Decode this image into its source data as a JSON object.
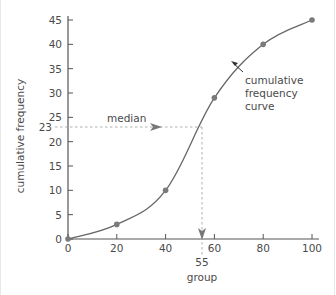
{
  "chart_data": {
    "type": "line",
    "title": "",
    "xlabel": "group",
    "ylabel": "cumulative frequency",
    "x": [
      0,
      20,
      40,
      60,
      80,
      100
    ],
    "series": [
      {
        "name": "cumulative frequency curve",
        "values": [
          0,
          3,
          10,
          29,
          40,
          45
        ]
      }
    ],
    "xlim": [
      0,
      100
    ],
    "ylim": [
      0,
      45
    ],
    "x_ticks": [
      "0",
      "20",
      "40",
      "60",
      "80",
      "100"
    ],
    "y_ticks": [
      "0",
      "5",
      "10",
      "15",
      "20",
      "25",
      "30",
      "35",
      "40",
      "45"
    ],
    "grid": false,
    "legend": "none",
    "annotations": [
      {
        "text": "median",
        "type": "dashed-arrow",
        "y": 23,
        "x_end": 55
      },
      {
        "text": "cumulative frequency curve",
        "type": "arrow-label",
        "points_to_x": 70
      },
      {
        "text": "23",
        "type": "axis-marker",
        "axis": "y",
        "value": 23
      },
      {
        "text": "55",
        "type": "axis-marker",
        "axis": "x",
        "value": 55
      }
    ]
  },
  "labels": {
    "xlabel": "group",
    "ylabel": "cumulative frequency",
    "median": "median",
    "curve_line1": "cumulative",
    "curve_line2": "frequency",
    "curve_line3": "curve",
    "median_y": "23",
    "median_x": "55"
  },
  "colors": {
    "axis": "#555555",
    "curve": "#666666",
    "points": "#7a7a7a",
    "dashed": "#b0b0b0",
    "text": "#4a4a4a"
  }
}
